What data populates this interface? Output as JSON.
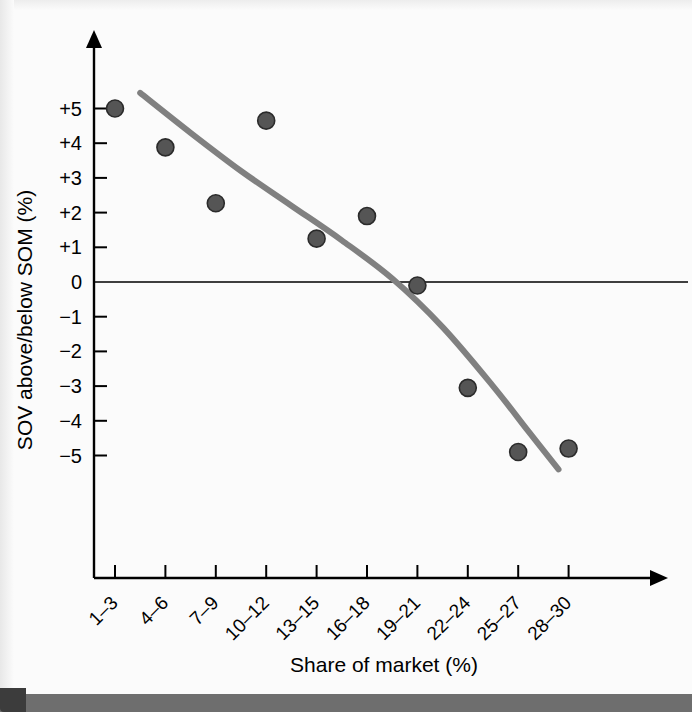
{
  "chart_data": {
    "type": "scatter",
    "title": "",
    "subtitle": "",
    "xlabel": "Share of market (%)",
    "ylabel": "SOV above/below SOM (%)",
    "categories": [
      "1–3",
      "4–6",
      "7–9",
      "10–12",
      "13–15",
      "16–18",
      "19–21",
      "22–24",
      "25–27",
      "28–30"
    ],
    "ytick_labels": [
      "+5",
      "+4",
      "+3",
      "+2",
      "+1",
      "0",
      "−1",
      "−2",
      "−3",
      "−4",
      "−5"
    ],
    "ytick_values": [
      5,
      4,
      3,
      2,
      1,
      0,
      -1,
      -2,
      -3,
      -4,
      -5
    ],
    "ylim": [
      -7.2,
      6.6
    ],
    "xlim": [
      0.2,
      11.3
    ],
    "grid": false,
    "legend": null,
    "zero_reference_line": 0,
    "points": [
      {
        "category": "1–3",
        "x": 1,
        "y": 5.0
      },
      {
        "category": "4–6",
        "x": 2,
        "y": 3.88
      },
      {
        "category": "7–9",
        "x": 3,
        "y": 2.27
      },
      {
        "category": "10–12",
        "x": 4,
        "y": 4.65
      },
      {
        "category": "13–15",
        "x": 5,
        "y": 1.25
      },
      {
        "category": "16–18",
        "x": 6,
        "y": 1.9
      },
      {
        "category": "19–21",
        "x": 7,
        "y": -0.1
      },
      {
        "category": "22–24",
        "x": 8,
        "y": -3.05
      },
      {
        "category": "25–27",
        "x": 9,
        "y": -4.9
      },
      {
        "category": "28–30",
        "x": 10,
        "y": -4.8
      }
    ],
    "trend_curve": {
      "style": "smoothed quadratic fit",
      "color": "#808080",
      "x_start": 1.5,
      "x_end": 9.8,
      "y_start": 5.45,
      "y_end": -5.4,
      "samples": [
        {
          "x": 1.5,
          "y": 5.45
        },
        {
          "x": 2.5,
          "y": 4.3
        },
        {
          "x": 3.5,
          "y": 3.2
        },
        {
          "x": 4.5,
          "y": 2.2
        },
        {
          "x": 5.5,
          "y": 1.2
        },
        {
          "x": 6.5,
          "y": 0.1
        },
        {
          "x": 7.5,
          "y": -1.3
        },
        {
          "x": 8.5,
          "y": -3.0
        },
        {
          "x": 9.2,
          "y": -4.3
        },
        {
          "x": 9.8,
          "y": -5.4
        }
      ]
    },
    "colors": {
      "point_fill": "#555555",
      "point_stroke": "#2b2b2b",
      "curve": "#808080",
      "axis": "#000000",
      "background": "#fbfbfb"
    }
  }
}
